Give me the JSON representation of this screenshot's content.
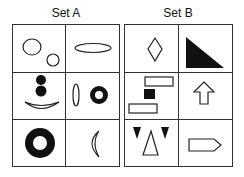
{
  "sets": [
    {
      "title": "Set A",
      "cells": [
        {
          "description": "Two outlined circles, large upper-left and small lower-right"
        },
        {
          "description": "Horizontal outlined ellipse"
        },
        {
          "description": "Two filled circles stacked above an outlined crescent bowl (smiley)"
        },
        {
          "description": "Vertical outlined ellipse beside a thick black ring"
        },
        {
          "description": "Large thick black ring"
        },
        {
          "description": "Outlined crescent moon"
        }
      ]
    },
    {
      "title": "Set B",
      "cells": [
        {
          "description": "Outlined diamond"
        },
        {
          "description": "Filled black right triangle"
        },
        {
          "description": "Two outlined rectangles with a filled black square between"
        },
        {
          "description": "Outlined upward arrow"
        },
        {
          "description": "Two filled black downward triangles flanking an outlined upward triangle"
        },
        {
          "description": "Outlined pentagon arrow pointing right"
        }
      ]
    }
  ]
}
